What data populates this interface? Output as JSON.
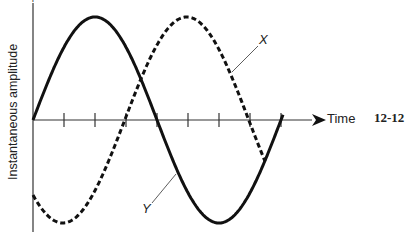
{
  "chart_data": {
    "type": "line",
    "title": "",
    "xlabel": "Time",
    "ylabel": "Instantaneous amplitude",
    "figure_number": "12-12",
    "axis_plus_marker": "+",
    "x_ticks": 8,
    "series": [
      {
        "name": "Y",
        "style": "solid",
        "description": "sine wave starting at zero, one full cycle",
        "phase_deg": 0,
        "cycles": 1.0
      },
      {
        "name": "X",
        "style": "dashed",
        "description": "sine wave lagging Y by 90 degrees",
        "phase_deg": -90,
        "cycles_shown": 0.93
      }
    ],
    "legend": []
  },
  "labels": {
    "y_axis": "Instantaneous amplitude",
    "x_axis": "Time",
    "figure": "12-12",
    "curve_x": "X",
    "curve_y": "Y",
    "plus": "+"
  }
}
